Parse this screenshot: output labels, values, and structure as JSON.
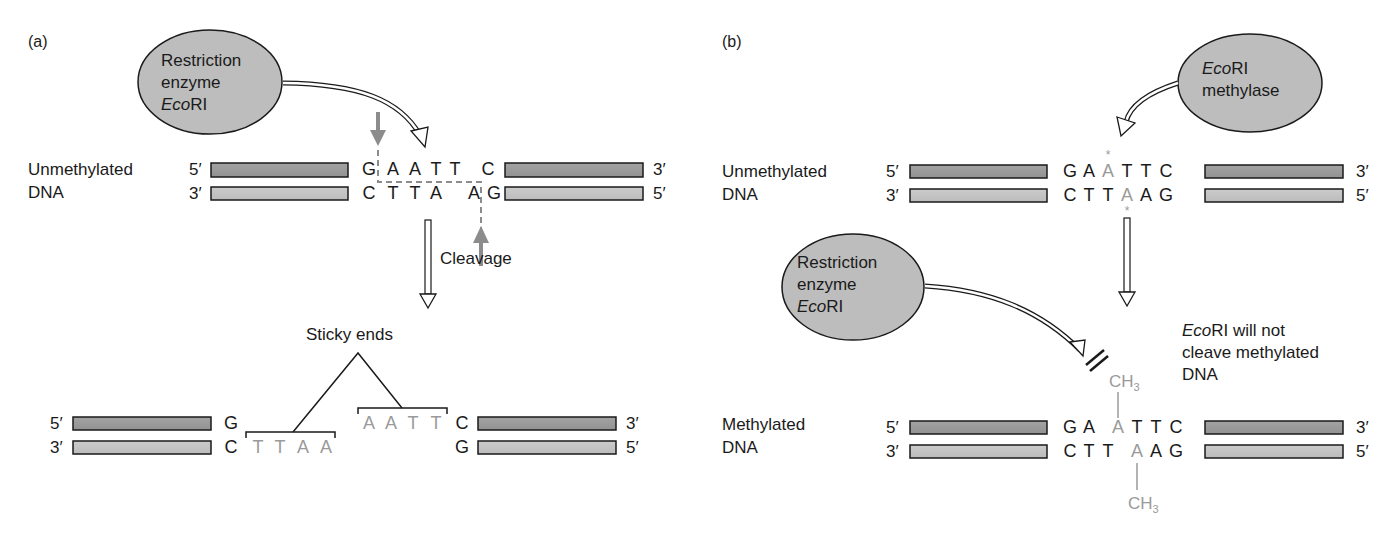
{
  "figure": {
    "panels": {
      "a": {
        "label": "(a)",
        "enzyme": {
          "line1": "Restriction",
          "line2": "enzyme",
          "line3_italic": "Eco",
          "line3_rest": "RI"
        },
        "dna_label": {
          "line1": "Unmethylated",
          "line2": "DNA"
        },
        "top_strand": {
          "left_end": "5′",
          "right_end": "3′",
          "bases": [
            "G",
            "A",
            "A",
            "T",
            "T",
            "C"
          ]
        },
        "bottom_strand": {
          "left_end": "3′",
          "right_end": "5′",
          "bases": [
            "C",
            "T",
            "T",
            "A",
            "A",
            "G"
          ]
        },
        "cleavage_label": "Cleavage",
        "sticky_ends_label": "Sticky ends",
        "product_left": {
          "top_end": "5′",
          "bottom_end": "3′",
          "top_base": "G",
          "bottom_base": "C",
          "overhang": [
            "T",
            "T",
            "A",
            "A"
          ]
        },
        "product_right": {
          "top_end": "3′",
          "bottom_end": "5′",
          "top_base": "C",
          "bottom_base": "G",
          "overhang": [
            "A",
            "A",
            "T",
            "T"
          ]
        }
      },
      "b": {
        "label": "(b)",
        "methylase": {
          "line1_italic": "Eco",
          "line1_rest": "RI",
          "line2": "methylase"
        },
        "unmethylated_label": {
          "line1": "Unmethylated",
          "line2": "DNA"
        },
        "unmethylated_top": {
          "left_end": "5′",
          "right_end": "3′",
          "bases": [
            "G",
            "A",
            "A",
            "T",
            "T",
            "C"
          ],
          "marked_index": 2
        },
        "unmethylated_bottom": {
          "left_end": "3′",
          "right_end": "5′",
          "bases": [
            "C",
            "T",
            "T",
            "A",
            "A",
            "G"
          ],
          "marked_index": 3
        },
        "methyl_mark": "*",
        "enzyme": {
          "line1": "Restriction",
          "line2": "enzyme",
          "line3_italic": "Eco",
          "line3_rest": "RI"
        },
        "note": {
          "line1_italic": "Eco",
          "line1_rest": "RI will not",
          "line2": "cleave methylated",
          "line3": "DNA"
        },
        "methyl_group": {
          "main": "CH",
          "sub": "3"
        },
        "methylated_label": {
          "line1": "Methylated",
          "line2": "DNA"
        },
        "methylated_top": {
          "left_end": "5′",
          "right_end": "3′",
          "bases": [
            "G",
            "A",
            "A",
            "T",
            "T",
            "C"
          ],
          "marked_index": 2
        },
        "methylated_bottom": {
          "left_end": "3′",
          "right_end": "5′",
          "bases": [
            "C",
            "T",
            "T",
            "A",
            "A",
            "G"
          ],
          "marked_index": 3
        }
      }
    },
    "colors": {
      "strand_dark": "#9b9b9b",
      "strand_light": "#c4c4c4",
      "ellipse_fill": "#bdbdbd",
      "methyl_gray": "#9a9a9a",
      "cleavage_arrow": "#8c8c8c"
    }
  }
}
